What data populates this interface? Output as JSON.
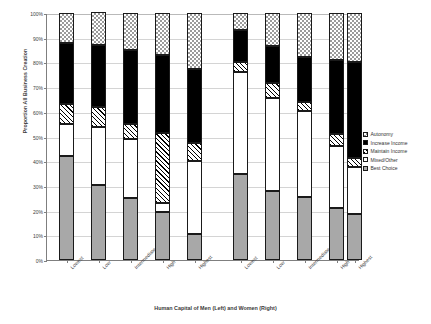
{
  "chart_data": {
    "type": "bar",
    "subtype": "stacked-percentage",
    "title": "",
    "xlabel": "Human Capital of Men (Left) and Women (Right)",
    "ylabel": "Proportion All Business Creation",
    "ylim": [
      0,
      100
    ],
    "yunit": "%",
    "ytick_labels": [
      "0%",
      "10%",
      "20%",
      "30%",
      "40%",
      "50%",
      "60%",
      "70%",
      "80%",
      "90%",
      "100%"
    ],
    "ytick_values": [
      0,
      10,
      20,
      30,
      40,
      50,
      60,
      70,
      80,
      90,
      100
    ],
    "grid": true,
    "legend_position": "right",
    "groups": [
      {
        "name": "Men",
        "side": "left"
      },
      {
        "name": "Women",
        "side": "right"
      }
    ],
    "categories": [
      "Lowest",
      "Low",
      "Intermediate",
      "High",
      "Highest"
    ],
    "series": [
      {
        "name": "Best Choice",
        "pattern": "gray-solid",
        "men": [
          42,
          30.5,
          25,
          19.5,
          10.5
        ],
        "women": [
          35,
          28,
          25.5,
          21,
          18.5
        ]
      },
      {
        "name": "Mixed/Other",
        "pattern": "white",
        "men": [
          13,
          23.5,
          24,
          3.5,
          29.5
        ],
        "women": [
          41,
          37.5,
          35,
          25,
          19
        ]
      },
      {
        "name": "Maintain Income",
        "pattern": "diagonal-hatch",
        "men": [
          8,
          8,
          6,
          28.5,
          7.5
        ],
        "women": [
          4,
          6,
          3.5,
          5,
          4
        ]
      },
      {
        "name": "Increase Income",
        "pattern": "black",
        "men": [
          25,
          25,
          30,
          31.5,
          30
        ],
        "women": [
          13,
          15,
          18,
          30,
          38.5
        ]
      },
      {
        "name": "Autonomy",
        "pattern": "checker",
        "men": [
          12,
          13.5,
          15,
          17,
          22.5
        ],
        "women": [
          7,
          13.5,
          18,
          19,
          20
        ]
      }
    ]
  },
  "legend": {
    "items": [
      {
        "label": "Autonomy",
        "pattern": "checker"
      },
      {
        "label": "Increase Income",
        "pattern": "black"
      },
      {
        "label": "Maintain Income",
        "pattern": "diagonal-hatch"
      },
      {
        "label": "Mixed/Other",
        "pattern": "white"
      },
      {
        "label": "Best Choice",
        "pattern": "gray-solid"
      }
    ]
  }
}
